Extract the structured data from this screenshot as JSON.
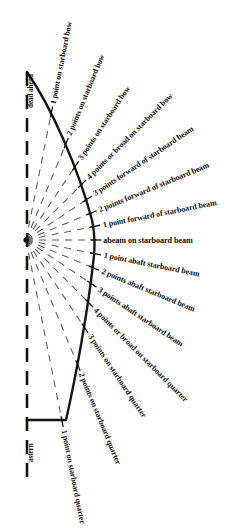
{
  "diagram": {
    "center": {
      "x": 26,
      "y": 240
    },
    "colors": {
      "ink": "#10100f",
      "hull": "#151514",
      "bearing_line": "#5a5a58",
      "centerline": "#111110",
      "background": "#ffffff"
    },
    "hull": {
      "bow": {
        "x": 27,
        "y": 72
      },
      "widest": {
        "x": 95,
        "y": 243
      },
      "stern_corner": {
        "x": 66,
        "y": 420
      },
      "stern_keel": {
        "x": 27,
        "y": 420
      }
    },
    "centerline": {
      "x": 27,
      "y_top": 72,
      "y_bottom": 481,
      "dash": "14 9"
    },
    "bearings": [
      {
        "id": "dead-ahead",
        "label": "dead ahead",
        "angle_deg": 0,
        "points": 0,
        "orientation": "vertical"
      },
      {
        "id": "1-point-starboard-bow",
        "label": "1 point on starboard bow",
        "angle_deg": 11.25,
        "points": 1,
        "orientation": "radial"
      },
      {
        "id": "2-points-starboard-bow",
        "label": "2 points on starboard bow",
        "angle_deg": 22.5,
        "points": 2,
        "orientation": "radial"
      },
      {
        "id": "3-points-starboard-bow",
        "label": "3 points on starboard bow",
        "angle_deg": 33.75,
        "points": 3,
        "orientation": "radial"
      },
      {
        "id": "4-points-broad-starboard-bow",
        "label": "4 points or broad on starboard bow",
        "angle_deg": 45,
        "points": 4,
        "orientation": "radial"
      },
      {
        "id": "3-points-forward-starboard-beam",
        "label": "3 points forward of starboard beam",
        "angle_deg": 56.25,
        "points": 5,
        "orientation": "radial"
      },
      {
        "id": "2-points-forward-starboard-beam",
        "label": "2 points forward of starboard beam",
        "angle_deg": 67.5,
        "points": 6,
        "orientation": "radial"
      },
      {
        "id": "1-point-forward-starboard-beam",
        "label": "1 point forward of starboard beam",
        "angle_deg": 78.75,
        "points": 7,
        "orientation": "radial"
      },
      {
        "id": "abeam-starboard-beam",
        "label": "abeam on starboard beam",
        "angle_deg": 90,
        "points": 8,
        "orientation": "horizontal"
      },
      {
        "id": "1-point-abaft-starboard-beam",
        "label": "1 point abaft starboard beam",
        "angle_deg": 101.25,
        "points": 9,
        "orientation": "radial"
      },
      {
        "id": "2-points-abaft-starboard-beam",
        "label": "2 points abaft starboard beam",
        "angle_deg": 112.5,
        "points": 10,
        "orientation": "radial"
      },
      {
        "id": "3-points-abaft-starboard-beam",
        "label": "3 points abaft starboard beam",
        "angle_deg": 123.75,
        "points": 11,
        "orientation": "radial"
      },
      {
        "id": "4-points-broad-starboard-quarter",
        "label": "4 points or broad on starboard quarter",
        "angle_deg": 135,
        "points": 12,
        "orientation": "radial"
      },
      {
        "id": "3-points-starboard-quarter",
        "label": "3 points on starboard quarter",
        "angle_deg": 146.25,
        "points": 13,
        "orientation": "radial"
      },
      {
        "id": "2-points-starboard-quarter",
        "label": "2 points on starboard quarter",
        "angle_deg": 157.5,
        "points": 14,
        "orientation": "radial"
      },
      {
        "id": "1-point-starboard-quarter",
        "label": "1 point on starboard quarter",
        "angle_deg": 168.75,
        "points": 15,
        "orientation": "radial"
      },
      {
        "id": "astern",
        "label": "astern",
        "angle_deg": 180,
        "points": 16,
        "orientation": "vertical"
      }
    ]
  }
}
